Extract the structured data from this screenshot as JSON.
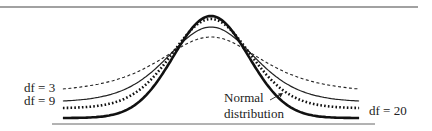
{
  "chart_data": {
    "type": "line",
    "title": "",
    "xlabel": "",
    "ylabel": "",
    "grid": false,
    "legend_position": "inline labels",
    "x_range": [
      -4,
      4
    ],
    "series": [
      {
        "name": "df = 3",
        "style": "dashed thin",
        "df": 3,
        "peak_density": 0.3676
      },
      {
        "name": "df = 9",
        "style": "solid thin",
        "df": 9,
        "peak_density": 0.388
      },
      {
        "name": "df = 20",
        "style": "dotted thick",
        "df": 20,
        "peak_density": 0.394
      },
      {
        "name": "Normal distribution",
        "style": "solid thick",
        "df": null,
        "peak_density": 0.3989
      }
    ],
    "annotations": [
      "Normal distribution (arrow pointing to curve)"
    ]
  },
  "labels": {
    "df3": "df = 3",
    "df9": "df = 9",
    "df20": "df = 20",
    "normal_line1": "Normal",
    "normal_line2": "distribution"
  }
}
